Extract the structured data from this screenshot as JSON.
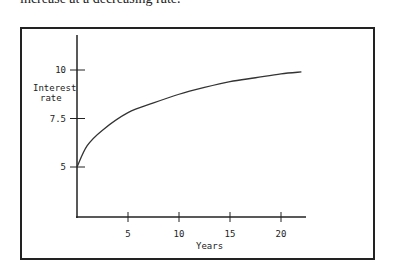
{
  "caption": "increase at a decreasing rate.",
  "chart_data": {
    "type": "line",
    "title": "",
    "xlabel": "Years",
    "ylabel": "Interest rate",
    "x_ticks": [
      5,
      10,
      15,
      20
    ],
    "y_ticks": [
      5,
      7.5,
      10
    ],
    "x_tick_labels": [
      "5",
      "10",
      "15",
      "20"
    ],
    "y_tick_labels": [
      "5",
      "7.5",
      "10"
    ],
    "xlim": [
      0,
      22.5
    ],
    "ylim": [
      2.5,
      11.7
    ],
    "grid": false,
    "series": [
      {
        "name": "Interest rate",
        "x": [
          0,
          1,
          2.5,
          5,
          7.5,
          10,
          12.5,
          15,
          17.5,
          20,
          22
        ],
        "values": [
          5,
          6.1,
          6.9,
          7.8,
          8.3,
          8.75,
          9.1,
          9.4,
          9.6,
          9.8,
          9.9
        ]
      }
    ]
  },
  "axis": {
    "ylabel_line1": "Interest",
    "ylabel_line2": "rate",
    "xlabel": "Years"
  }
}
